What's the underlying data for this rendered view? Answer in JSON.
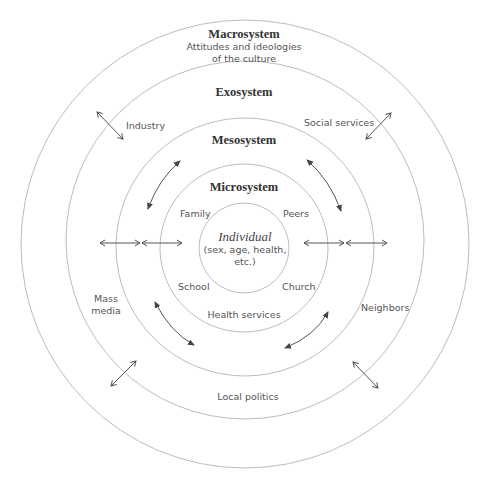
{
  "diagram": {
    "layers": {
      "macrosystem": {
        "title": "Macrosystem",
        "desc_line1": "Attitudes and ideologies",
        "desc_line2": "of the culture"
      },
      "exosystem": {
        "title": "Exosystem",
        "items": [
          "Industry",
          "Social services",
          "Mass",
          "media",
          "Neighbors",
          "Local politics"
        ]
      },
      "mesosystem": {
        "title": "Mesosystem"
      },
      "microsystem": {
        "title": "Microsystem",
        "items": [
          "Family",
          "Peers",
          "School",
          "Church",
          "Health services"
        ]
      },
      "individual": {
        "title": "Individual",
        "desc_line1": "(sex, age, health,",
        "desc_line2": "etc.)"
      }
    },
    "colors": {
      "ring": "#bdbdbd",
      "arrow": "#555555",
      "title_text": "#333333",
      "label_text": "#555555"
    }
  }
}
